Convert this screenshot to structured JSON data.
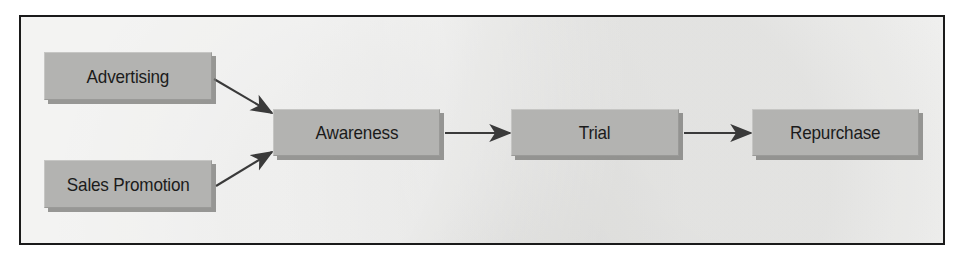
{
  "figure": {
    "type": "flow-diagram",
    "title": "",
    "frame_color": "#1a1a1a",
    "background_color": "#e9e9e7",
    "node_fill_color": "#b3b3b1",
    "node_text_color": "#1b1b1b",
    "arrow_color": "#3a3a3a"
  },
  "nodes": [
    {
      "id": "advertising",
      "label": "Advertising"
    },
    {
      "id": "sales-promotion",
      "label": "Sales Promotion"
    },
    {
      "id": "awareness",
      "label": "Awareness"
    },
    {
      "id": "trial",
      "label": "Trial"
    },
    {
      "id": "repurchase",
      "label": "Repurchase"
    }
  ],
  "edges": [
    {
      "id": "advertising-to-awareness",
      "from": "Advertising",
      "to": "Awareness",
      "style": "diagonal-down"
    },
    {
      "id": "sales-promotion-to-awareness",
      "from": "Sales Promotion",
      "to": "Awareness",
      "style": "diagonal-up"
    },
    {
      "id": "awareness-to-trial",
      "from": "Awareness",
      "to": "Trial",
      "style": "horizontal"
    },
    {
      "id": "trial-to-repurchase",
      "from": "Trial",
      "to": "Repurchase",
      "style": "horizontal"
    }
  ]
}
